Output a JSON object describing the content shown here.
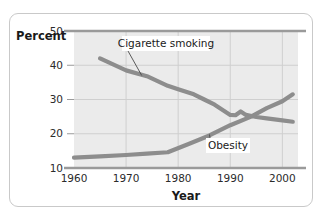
{
  "chart_data": {
    "type": "line",
    "title": "",
    "xlabel": "Year",
    "ylabel": "Percent",
    "xlim": [
      1960,
      2003
    ],
    "ylim": [
      10,
      50
    ],
    "xticks": [
      1960,
      1970,
      1980,
      1990,
      2000
    ],
    "yticks": [
      10,
      20,
      30,
      40,
      50
    ],
    "xtick_labels": [
      "1960",
      "1970",
      "1980",
      "1990",
      "2000"
    ],
    "ytick_labels": [
      "10",
      "20",
      "30",
      "40",
      "50"
    ],
    "grid": true,
    "legend": "annotations-on-plot",
    "series": [
      {
        "name": "Cigarette smoking",
        "color": "#8d8d8d",
        "x": [
          1965,
          1970,
          1974,
          1978,
          1980,
          1983,
          1985,
          1987,
          1990,
          1991,
          1992,
          1993,
          1995,
          1997,
          2000,
          2002
        ],
        "values": [
          42.0,
          38.5,
          36.8,
          34.0,
          33.0,
          31.5,
          30.0,
          28.5,
          25.5,
          25.4,
          26.5,
          25.5,
          24.9,
          24.5,
          23.9,
          23.5
        ]
      },
      {
        "name": "Obesity",
        "color": "#8d8d8d",
        "x": [
          1960,
          1965,
          1970,
          1974,
          1978,
          1982,
          1986,
          1990,
          1994,
          1997,
          2000,
          2002
        ],
        "values": [
          13.0,
          13.4,
          13.8,
          14.2,
          14.6,
          17.0,
          19.5,
          22.5,
          25.0,
          27.5,
          29.5,
          31.5
        ]
      }
    ],
    "annotations": [
      {
        "label": "Cigarette smoking",
        "points_to_series": "Cigarette smoking",
        "points_to_x": 1973,
        "points_to_y": 37.0
      },
      {
        "label": "Obesity",
        "points_to_series": "Obesity",
        "points_to_x": 1986,
        "points_to_y": 19.8
      }
    ]
  },
  "colors": {
    "plot_background": "#ebebeb",
    "grid_line": "#cfcfcf",
    "axis_rule": "#9a9a9a",
    "series_line": "#8d8d8d",
    "card_border": "#c9c9c9",
    "text": "#1a1a1a"
  }
}
